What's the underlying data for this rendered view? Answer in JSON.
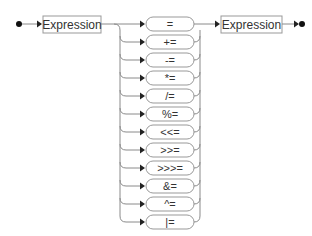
{
  "diagram": {
    "type": "railroad-syntax-diagram",
    "start_node": "start",
    "left_operand": "Expression",
    "right_operand": "Expression",
    "end_node": "end",
    "operators": [
      "=",
      "+=",
      "-=",
      "*=",
      "/=",
      "%=",
      "<<=",
      ">>=",
      ">>>=",
      "&=",
      "^=",
      "|="
    ],
    "colors": {
      "line": "#888888",
      "box_border": "#999999",
      "text": "#333333",
      "terminal_dot": "#111111"
    }
  }
}
